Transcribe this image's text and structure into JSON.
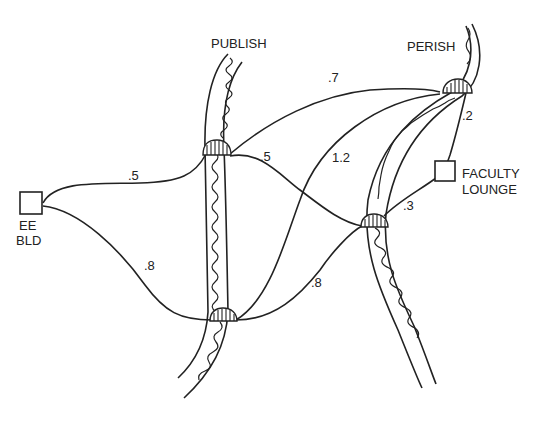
{
  "diagram": {
    "type": "weighted-graph",
    "rivers": [
      {
        "name": "PUBLISH"
      },
      {
        "name": "PERISH"
      }
    ],
    "nodes": [
      {
        "id": "ee_bld",
        "label_line1": "EE",
        "label_line2": "BLD",
        "kind": "building"
      },
      {
        "id": "faculty_lounge",
        "label_line1": "FACULTY",
        "label_line2": "LOUNGE",
        "kind": "building"
      },
      {
        "id": "publish_upper_bridge",
        "kind": "bridge"
      },
      {
        "id": "publish_lower_bridge",
        "kind": "bridge"
      },
      {
        "id": "perish_upper_bridge",
        "kind": "bridge"
      },
      {
        "id": "perish_lower_bridge",
        "kind": "bridge"
      }
    ],
    "edges": [
      {
        "from": "ee_bld",
        "to": "publish_upper_bridge",
        "weight": ".5"
      },
      {
        "from": "ee_bld",
        "to": "publish_lower_bridge",
        "weight": ".8"
      },
      {
        "from": "publish_upper_bridge",
        "to": "perish_upper_bridge",
        "weight": ".7"
      },
      {
        "from": "publish_upper_bridge",
        "to": "perish_lower_bridge",
        "weight": ".5"
      },
      {
        "from": "publish_lower_bridge",
        "to": "perish_upper_bridge",
        "weight": "1.2"
      },
      {
        "from": "publish_lower_bridge",
        "to": "perish_lower_bridge",
        "weight": ".8"
      },
      {
        "from": "perish_upper_bridge",
        "to": "faculty_lounge",
        "weight": ".2"
      },
      {
        "from": "perish_lower_bridge",
        "to": "faculty_lounge",
        "weight": ".3"
      }
    ]
  }
}
